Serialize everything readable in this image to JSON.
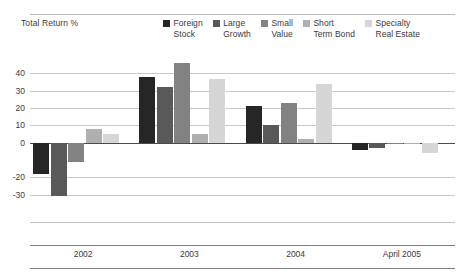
{
  "header": {
    "axis_title": "Total Return %"
  },
  "legend": {
    "position": "top-right",
    "items": [
      {
        "label": "Foreign\nStock",
        "color": "#262626"
      },
      {
        "label": "Large\nGrowth",
        "color": "#595959"
      },
      {
        "label": "Small\nValue",
        "color": "#828282"
      },
      {
        "label": "Short\nTerm Bond",
        "color": "#b0b0b0"
      },
      {
        "label": "Specialty\nReal Estate",
        "color": "#d6d6d6"
      }
    ]
  },
  "chart_data": {
    "type": "bar",
    "title": "",
    "subtitle": "",
    "xlabel": "",
    "ylabel": "Total Return %",
    "grid": true,
    "legend_position": "top-right",
    "ylim": [
      -40,
      50
    ],
    "yticks": [
      40,
      30,
      20,
      10,
      0,
      -20,
      -30
    ],
    "ytick_labels": [
      "40",
      "30",
      "20",
      "10",
      "0",
      "-20",
      "-30"
    ],
    "categories": [
      "2002",
      "2003",
      "2004",
      "April 2005"
    ],
    "series": [
      {
        "name": "Foreign Stock",
        "color": "#262626",
        "values": [
          -18,
          38,
          21,
          -4
        ]
      },
      {
        "name": "Large Growth",
        "color": "#595959",
        "values": [
          -31,
          32,
          10,
          -3
        ]
      },
      {
        "name": "Small Value",
        "color": "#828282",
        "values": [
          -11,
          46,
          23,
          -1
        ]
      },
      {
        "name": "Short Term Bond",
        "color": "#b0b0b0",
        "values": [
          8,
          5,
          2,
          0
        ]
      },
      {
        "name": "Specialty Real Estate",
        "color": "#d6d6d6",
        "values": [
          5,
          37,
          34,
          -6
        ]
      }
    ]
  },
  "colors": {
    "gridline": "#c9c9c9",
    "zeroline": "#4a4a4a",
    "text": "#3a3a3a",
    "background": "#ffffff"
  }
}
